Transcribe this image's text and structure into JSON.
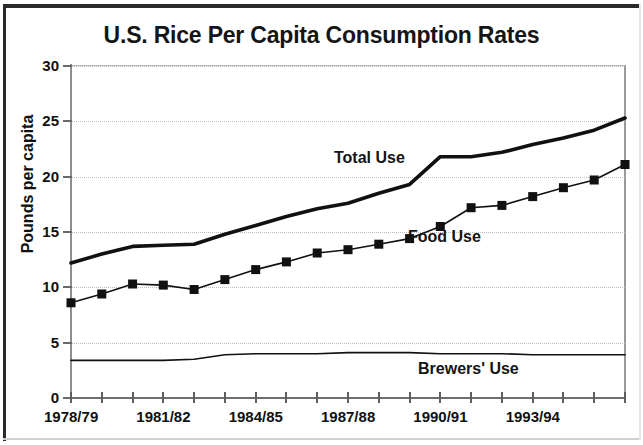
{
  "chart_data": {
    "type": "line",
    "title": "U.S. Rice Per Capita Consumption Rates",
    "xlabel": "",
    "ylabel": "Pounds per capita",
    "ylim": [
      0,
      30
    ],
    "yticks": [
      0,
      5,
      10,
      15,
      20,
      25,
      30
    ],
    "ytick_labels": [
      "0",
      "5",
      "10",
      "15",
      "20",
      "25",
      "30"
    ],
    "grid": true,
    "grid_style": "dotted",
    "legend": "inline-labels",
    "x": [
      "1978/79",
      "1979/80",
      "1980/81",
      "1981/82",
      "1982/83",
      "1983/84",
      "1984/85",
      "1985/86",
      "1986/87",
      "1987/88",
      "1988/89",
      "1989/90",
      "1990/91",
      "1991/92",
      "1992/93",
      "1993/94",
      "1994/95",
      "1995/96",
      "1996/97"
    ],
    "xtick_labels_shown": [
      "1978/79",
      "1981/82",
      "1984/85",
      "1987/88",
      "1990/91",
      "1993/94"
    ],
    "xtick_label_indices": [
      0,
      3,
      6,
      9,
      12,
      15
    ],
    "series": [
      {
        "name": "Total Use",
        "color": "#111111",
        "line_width": 3.6,
        "markers": false,
        "values": [
          12.2,
          13.0,
          13.7,
          13.8,
          13.9,
          14.8,
          15.6,
          16.4,
          17.1,
          17.6,
          18.5,
          19.3,
          21.8,
          21.8,
          22.2,
          22.9,
          23.5,
          24.2,
          25.3
        ]
      },
      {
        "name": "Food Use",
        "color": "#111111",
        "line_width": 1.6,
        "markers": true,
        "marker": "square",
        "marker_size": 9,
        "values": [
          8.6,
          9.4,
          10.3,
          10.2,
          9.8,
          10.7,
          11.6,
          12.3,
          13.1,
          13.4,
          13.9,
          14.4,
          15.5,
          17.2,
          17.4,
          18.2,
          19.0,
          19.7,
          21.1
        ]
      },
      {
        "name": "Brewers' Use",
        "color": "#111111",
        "line_width": 1.6,
        "markers": false,
        "values": [
          3.4,
          3.4,
          3.4,
          3.4,
          3.5,
          3.9,
          4.0,
          4.0,
          4.0,
          4.1,
          4.1,
          4.1,
          4.0,
          4.0,
          4.0,
          3.9,
          3.9,
          3.9,
          3.9
        ]
      }
    ],
    "annotations": [
      {
        "text": "Total Use",
        "x_frac": 0.47,
        "y_value": 20.6
      },
      {
        "text": "Food Use",
        "x_frac": 0.61,
        "y_value": 13.6
      },
      {
        "text": "Brewers' Use",
        "x_frac": 0.63,
        "y_value": 1.6
      }
    ]
  }
}
